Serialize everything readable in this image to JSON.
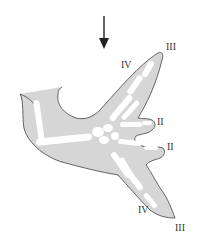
{
  "figure": {
    "colors": {
      "outline": "#555555",
      "tissue": "#d6d6d6",
      "bone": "#ffffff",
      "arrow": "#222222",
      "label": "#333333"
    },
    "arrow": {
      "direction": "down"
    },
    "labels": {
      "upper_digit_tip": "III",
      "upper_digit_side": "IV",
      "middle_digit_1": "II",
      "middle_digit_2": "II",
      "lower_digit_side": "IV",
      "lower_digit_tip": "III"
    }
  }
}
